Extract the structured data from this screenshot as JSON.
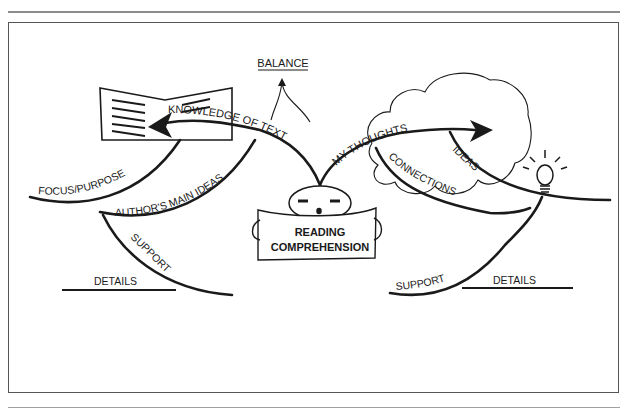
{
  "diagram": {
    "type": "concept-map",
    "center": {
      "label_line1": "READING",
      "label_line2": "COMPREHENSION"
    },
    "balance": {
      "label": "BALANCE"
    },
    "left_branch": {
      "main": "KNOWLEDGE OF TEXT",
      "sub1": "FOCUS/PURPOSE",
      "sub2": "AUTHOR'S MAIN IDEAS",
      "sub3": "SUPPORT",
      "sub4": "DETAILS",
      "icon": "open-book-icon"
    },
    "right_branch": {
      "main": "MY THOUGHTS",
      "sub1": "CONNECTIONS",
      "sub2": "IDEAS",
      "sub3": "SUPPORT",
      "sub4": "DETAILS",
      "icons": [
        "thought-cloud-icon",
        "lightbulb-icon"
      ]
    },
    "colors": {
      "ink": "#1a1a1a",
      "frame": "#555555",
      "background": "#ffffff"
    }
  }
}
